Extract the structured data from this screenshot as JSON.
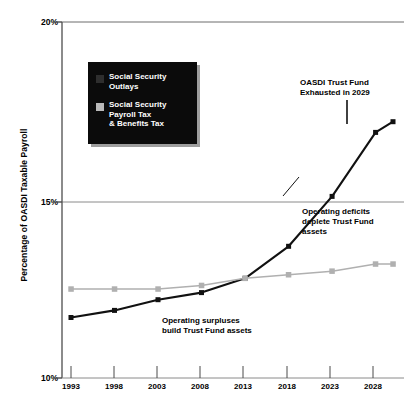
{
  "chart_data": {
    "type": "line",
    "title": "",
    "xlabel": "",
    "ylabel": "Percentage of OASDI Taxable Payroll",
    "x": [
      1993,
      1998,
      2003,
      2008,
      2013,
      2018,
      2023,
      2028,
      2030
    ],
    "xlim": [
      1993,
      2030
    ],
    "ylim": [
      10,
      20
    ],
    "ytick_labels": [
      "10%",
      "15%",
      "20%"
    ],
    "ytick_values": [
      10,
      15,
      20
    ],
    "xtick_labels": [
      "1993",
      "1998",
      "2003",
      "2008",
      "2013",
      "2018",
      "2023",
      "2028"
    ],
    "xtick_values": [
      1993,
      1998,
      2003,
      2008,
      2013,
      2018,
      2023,
      2028
    ],
    "grid": "horizontal-gridlines-at-15-and-20",
    "legend_position": "upper-left-inset",
    "series": [
      {
        "name": "Social Security Outlays",
        "color": "#111111",
        "marker": "square",
        "values": [
          11.7,
          11.9,
          12.2,
          12.4,
          12.8,
          13.7,
          15.1,
          16.9,
          17.2
        ]
      },
      {
        "name": "Social Security Payroll Tax & Benefits Tax",
        "color": "#b0b0b0",
        "marker": "square",
        "values": [
          12.5,
          12.5,
          12.5,
          12.6,
          12.8,
          12.9,
          13.0,
          13.2,
          13.2
        ]
      }
    ],
    "annotations": [
      {
        "id": "exhausted",
        "text": "OASDI Trust Fund\nExhausted in 2029",
        "year": 2029
      },
      {
        "id": "deficits",
        "text": "Operating deficits\ndeplete Trust Fund\nassets"
      },
      {
        "id": "surpluses",
        "text": "Operating surpluses\nbuild Trust Fund assets"
      }
    ]
  },
  "legend": {
    "entries": [
      {
        "label": "Social Security\nOutlays",
        "swatch": "dark-square-swatch"
      },
      {
        "label": "Social Security\nPayroll Tax\n& Benefits Tax",
        "swatch": "light-square-swatch"
      }
    ],
    "background_color": "#0b0b0b",
    "text_color": "#ffffff"
  },
  "axes": {
    "y_label": "Percentage of OASDI Taxable Payroll",
    "y_ticks": [
      "20%",
      "15%",
      "10%"
    ],
    "x_ticks": [
      "1993",
      "1998",
      "2003",
      "2008",
      "2013",
      "2018",
      "2023",
      "2028"
    ]
  }
}
